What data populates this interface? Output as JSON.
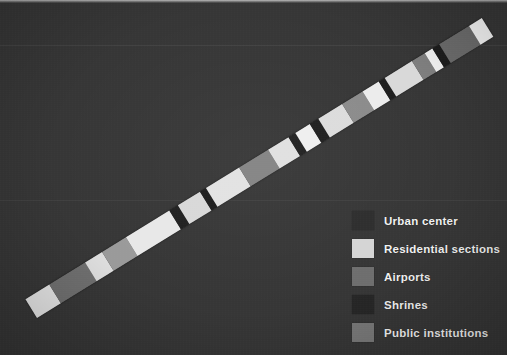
{
  "figure": {
    "type": "stacked-strip-bar",
    "background_color": "#363636",
    "orientation": "diagonal-ascending"
  },
  "legend": {
    "items": [
      {
        "label": "Urban center",
        "color": "#2d2d2d",
        "key": "urban-center"
      },
      {
        "label": "Residential sections",
        "color": "#d5d5d5",
        "key": "residential-sections"
      },
      {
        "label": "Airports",
        "color": "#6e6e6e",
        "key": "airports"
      },
      {
        "label": "Shrines",
        "color": "#262626",
        "key": "shrines"
      },
      {
        "label": "Public institutions",
        "color": "#787878",
        "key": "public-institutions"
      }
    ]
  },
  "chart_data": {
    "type": "bar",
    "title": "",
    "xlabel": "",
    "ylabel": "",
    "categories": [
      "Residential sections",
      "Public institutions",
      "Residential sections",
      "Airports",
      "Residential sections",
      "Shrines",
      "Residential sections",
      "Shrines",
      "Residential sections",
      "Public institutions",
      "Residential sections",
      "Shrines",
      "Residential sections",
      "Shrines",
      "Residential sections",
      "Airports",
      "Residential sections",
      "Shrines",
      "Residential sections",
      "Airports",
      "Residential sections",
      "Shrines",
      "Airports",
      "Residential sections"
    ],
    "values": [
      30,
      45,
      22,
      30,
      55,
      10,
      28,
      8,
      42,
      36,
      26,
      9,
      18,
      11,
      30,
      26,
      20,
      8,
      34,
      16,
      10,
      9,
      37,
      16
    ],
    "colors": [
      "#e4e4e4",
      "#6f6f6f",
      "#dddddd",
      "#9a9a9a",
      "#e8e8e8",
      "#1f1f1f",
      "#d8d8d8",
      "#1c1c1c",
      "#e2e2e2",
      "#838383",
      "#e0e0e0",
      "#202020",
      "#efefef",
      "#1e1e1e",
      "#dcdcdc",
      "#8b8b8b",
      "#ececec",
      "#1d1d1d",
      "#d9d9d9",
      "#7f7f7f",
      "#f1f1f1",
      "#1b1b1b",
      "#6b6b6b",
      "#f4f4f4"
    ],
    "series": [
      {
        "name": "Land use composition along transect",
        "values": [
          30,
          45,
          22,
          30,
          55,
          10,
          28,
          8,
          42,
          36,
          26,
          9,
          18,
          11,
          30,
          26,
          20,
          8,
          34,
          16,
          10,
          9,
          37,
          16
        ]
      }
    ],
    "total": 566,
    "grid": false,
    "legend_position": "lower-right",
    "axis_ranges": {
      "x": [
        0,
        566
      ],
      "y": [
        0,
        1
      ]
    }
  },
  "geometry": {
    "start_x": 37,
    "start_y": 318,
    "end_x": 493,
    "end_y": 37,
    "thickness_px": 22,
    "angle_deg": -31.6
  }
}
